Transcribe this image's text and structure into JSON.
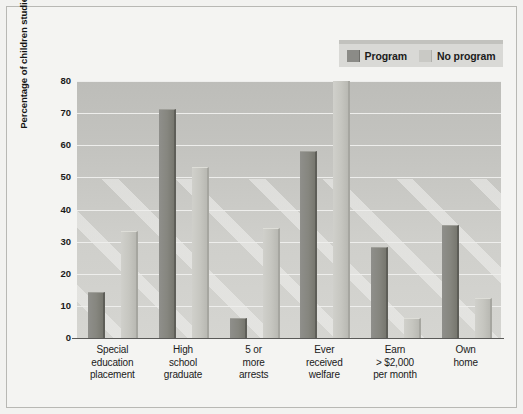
{
  "chart_data": {
    "type": "bar",
    "title": "",
    "xlabel": "",
    "ylabel": "Percentage of children studied",
    "ylim": [
      0,
      80
    ],
    "yticks": [
      0,
      10,
      20,
      30,
      40,
      50,
      60,
      70,
      80
    ],
    "ytick_labels": [
      "0",
      "10",
      "20",
      "30",
      "40",
      "50",
      "60",
      "70",
      "80"
    ],
    "grid": true,
    "legend_position": "top-right",
    "categories": [
      "Special education placement",
      "High school graduate",
      "5 or more arrests",
      "Ever received welfare",
      "Earn > $2,000 per month",
      "Own home"
    ],
    "category_lines": [
      [
        "Special",
        "education",
        "placement"
      ],
      [
        "High",
        "school",
        "graduate"
      ],
      [
        "5 or",
        "more",
        "arrests"
      ],
      [
        "Ever",
        "received",
        "welfare"
      ],
      [
        "Earn",
        "> $2,000",
        "per month"
      ],
      [
        "Own",
        "home"
      ]
    ],
    "series": [
      {
        "name": "Program",
        "color": "#86867f",
        "values": [
          14,
          71,
          6,
          58,
          28,
          35
        ]
      },
      {
        "name": "No program",
        "color": "#c6c6c0",
        "values": [
          33,
          53,
          34,
          80,
          6,
          12
        ]
      }
    ]
  },
  "legend": {
    "entries": [
      {
        "label": "Program",
        "swatch": "program"
      },
      {
        "label": "No program",
        "swatch": "noprogram"
      }
    ]
  },
  "colors": {
    "figure_background": "#f2f2f0",
    "plot_background": "#c6c6c2",
    "gridline": "#eeeeec",
    "axis": "#5a5a58",
    "legend_background": "#d9d9d6",
    "program_bar": "#86867f",
    "no_program_bar": "#c6c6c0",
    "text": "#1a1a1a"
  }
}
